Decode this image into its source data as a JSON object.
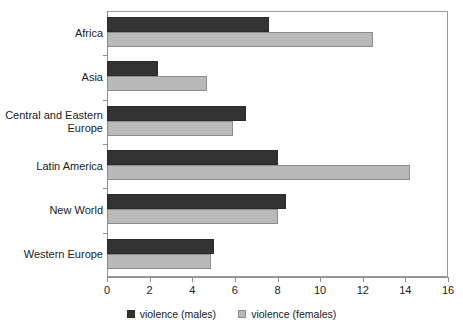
{
  "chart_data": {
    "type": "bar",
    "orientation": "horizontal",
    "title": "",
    "xlabel": "",
    "ylabel": "",
    "xlim": [
      0,
      16
    ],
    "xticks": [
      0,
      2,
      4,
      6,
      8,
      10,
      12,
      14,
      16
    ],
    "grid": false,
    "legend_position": "bottom",
    "categories": [
      "Africa",
      "Asia",
      "Central and Eastern Europe",
      "Latin America",
      "New World",
      "Western Europe"
    ],
    "series": [
      {
        "name": "violence (males)",
        "color": "#333333",
        "values": [
          7.6,
          2.4,
          6.5,
          8.0,
          8.4,
          5.0
        ]
      },
      {
        "name": "violence (females)",
        "color": "#b9b9b9",
        "values": [
          12.5,
          4.7,
          5.9,
          14.2,
          8.0,
          4.9
        ]
      }
    ]
  },
  "category_labels": [
    {
      "line1": "Africa",
      "line2": ""
    },
    {
      "line1": "Asia",
      "line2": ""
    },
    {
      "line1": "Central and Eastern",
      "line2": "Europe"
    },
    {
      "line1": "Latin America",
      "line2": ""
    },
    {
      "line1": "New World",
      "line2": ""
    },
    {
      "line1": "Western Europe",
      "line2": ""
    }
  ]
}
